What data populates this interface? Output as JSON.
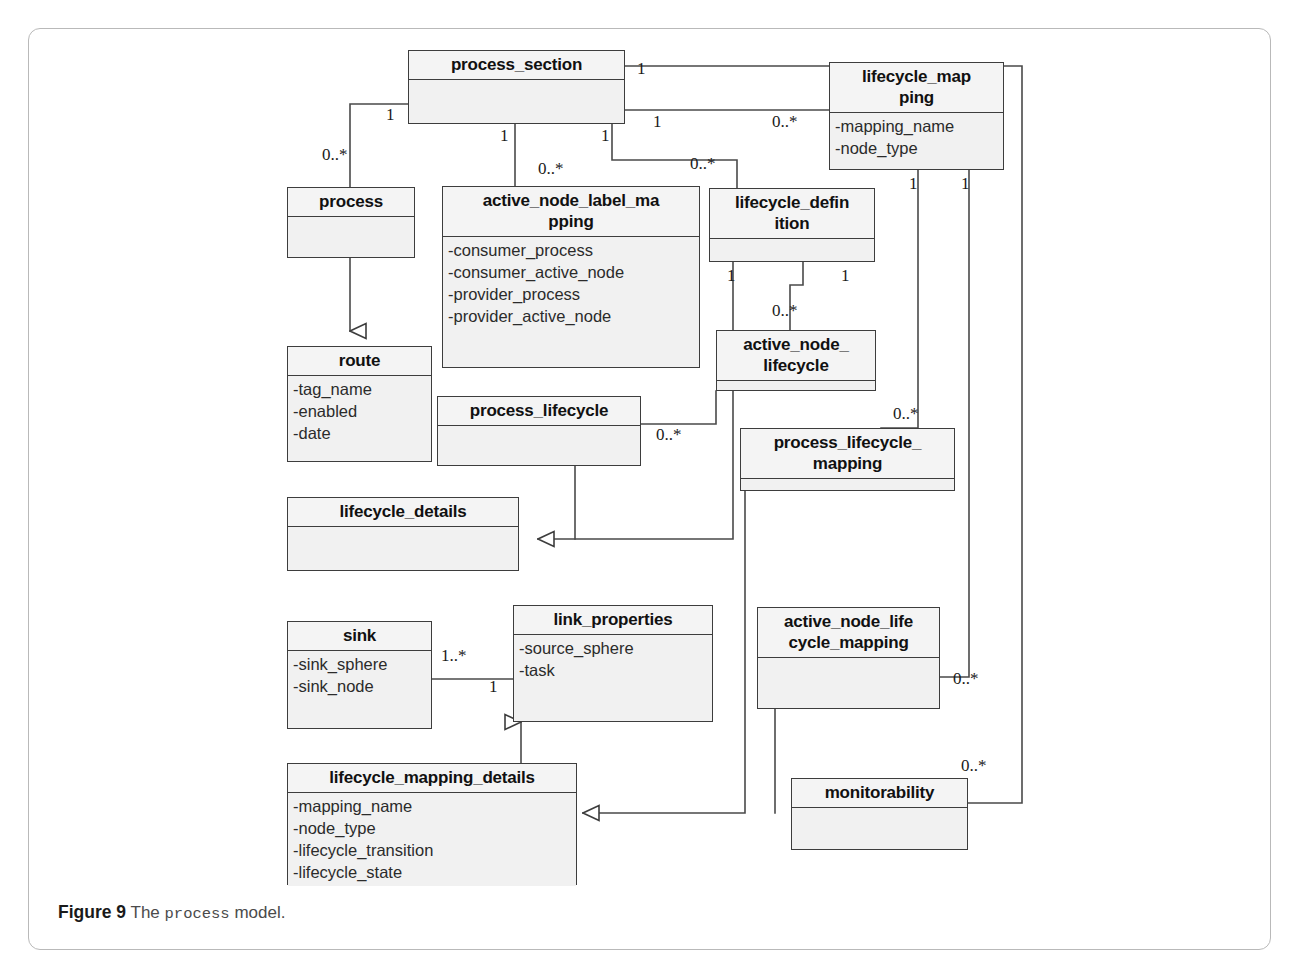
{
  "figure": {
    "caption_label": "Figure 9",
    "caption_text_before": "The",
    "caption_mono": "process",
    "caption_text_after": "model."
  },
  "diagram": {
    "type": "uml-class-diagram",
    "classes": [
      {
        "id": "process_section",
        "name": "process_section",
        "attributes": []
      },
      {
        "id": "lifecycle_mapping",
        "name": "lifecycle_map\nping",
        "attributes": [
          "-mapping_name",
          "-node_type"
        ]
      },
      {
        "id": "process",
        "name": "process",
        "attributes": []
      },
      {
        "id": "active_node_label_mapping",
        "name": "active_node_label_ma\npping",
        "attributes": [
          "-consumer_process",
          "-consumer_active_node",
          "-provider_process",
          "-provider_active_node"
        ]
      },
      {
        "id": "lifecycle_definition",
        "name": "lifecycle_defin\nition",
        "attributes": []
      },
      {
        "id": "route",
        "name": "route",
        "attributes": [
          "-tag_name",
          "-enabled",
          "-date"
        ]
      },
      {
        "id": "active_node_lifecycle",
        "name": "active_node_\nlifecycle",
        "attributes": []
      },
      {
        "id": "process_lifecycle",
        "name": "process_lifecycle",
        "attributes": []
      },
      {
        "id": "process_lifecycle_mapping",
        "name": "process_lifecycle_\nmapping",
        "attributes": []
      },
      {
        "id": "lifecycle_details",
        "name": "lifecycle_details",
        "attributes": []
      },
      {
        "id": "sink",
        "name": "sink",
        "attributes": [
          "-sink_sphere",
          "-sink_node"
        ]
      },
      {
        "id": "link_properties",
        "name": "link_properties",
        "attributes": [
          "-source_sphere",
          "-task"
        ]
      },
      {
        "id": "active_node_lifecycle_mapping",
        "name": "active_node_life\ncycle_mapping",
        "attributes": []
      },
      {
        "id": "lifecycle_mapping_details",
        "name": "lifecycle_mapping_details",
        "attributes": [
          "-mapping_name",
          "-node_type",
          "-lifecycle_transition",
          "-lifecycle_state"
        ]
      },
      {
        "id": "monitorability",
        "name": "monitorability",
        "attributes": []
      }
    ],
    "multiplicities": [
      {
        "id": "m1",
        "text": "1",
        "note": "process_section top-right to lifecycle_mapping chain"
      },
      {
        "id": "m2",
        "text": "1",
        "note": "process_section left to process"
      },
      {
        "id": "m3",
        "text": "1",
        "note": "process_section right association"
      },
      {
        "id": "m4",
        "text": "0..*",
        "note": "lifecycle_mapping end of right association"
      },
      {
        "id": "m5",
        "text": "0..*",
        "note": "process end"
      },
      {
        "id": "m6",
        "text": "1",
        "note": "process_section bottom to active_node_label_mapping"
      },
      {
        "id": "m7",
        "text": "0..*",
        "note": "active_node_label_mapping end"
      },
      {
        "id": "m8",
        "text": "1",
        "note": "process_section bottom-right to lifecycle_definition"
      },
      {
        "id": "m9",
        "text": "0..*",
        "note": "lifecycle_definition end"
      },
      {
        "id": "m10",
        "text": "1",
        "note": "lifecycle_definition left bottom"
      },
      {
        "id": "m11",
        "text": "1",
        "note": "lifecycle_definition right bottom"
      },
      {
        "id": "m12",
        "text": "0..*",
        "note": "active_node_lifecycle end"
      },
      {
        "id": "m13",
        "text": "1",
        "note": "lifecycle_mapping bottom-left"
      },
      {
        "id": "m14",
        "text": "1",
        "note": "lifecycle_mapping bottom-right"
      },
      {
        "id": "m15",
        "text": "0..*",
        "note": "process_lifecycle_mapping end"
      },
      {
        "id": "m16",
        "text": "0..*",
        "note": "process_lifecycle right end"
      },
      {
        "id": "m17",
        "text": "1..*",
        "note": "sink to link_properties"
      },
      {
        "id": "m18",
        "text": "1",
        "note": "link_properties end"
      },
      {
        "id": "m19",
        "text": "0..*",
        "note": "active_node_lifecycle_mapping end"
      },
      {
        "id": "m20",
        "text": "0..*",
        "note": "monitorability end"
      }
    ]
  }
}
